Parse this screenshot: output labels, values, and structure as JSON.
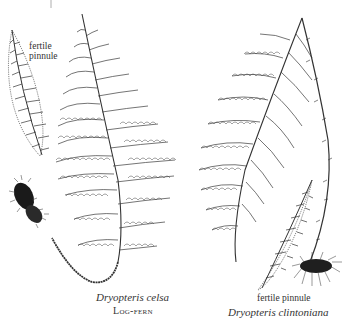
{
  "figure": {
    "left_plant": {
      "species": "Dryopteris celsa",
      "common_name": "Log-fern",
      "inset_label_line1": "fertile",
      "inset_label_line2": "pinnule"
    },
    "right_plant": {
      "species": "Dryopteris clintoniana",
      "inset_label": "fertile pinnule"
    },
    "colors": {
      "ink": "#2a2a2a",
      "background": "#ffffff"
    }
  }
}
